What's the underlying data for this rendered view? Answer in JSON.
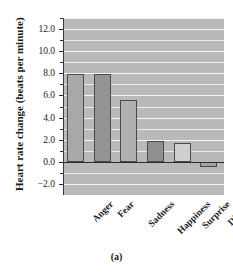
{
  "figure": {
    "caption": "(a)",
    "ylabel": "Heart rate change (beats per minute)"
  },
  "chart_data": {
    "type": "bar",
    "title": "",
    "xlabel": "",
    "ylabel": "Heart rate change (beats per minute)",
    "categories": [
      "Anger",
      "Fear",
      "Sadness",
      "Happiness",
      "Surprise",
      "Disgust"
    ],
    "values": [
      7.9,
      7.9,
      5.6,
      1.9,
      1.7,
      -0.5
    ],
    "bar_colors": [
      "#a8a8a8",
      "#949494",
      "#b0b0b0",
      "#8f8f8f",
      "#cfcfcf",
      "#a3a3a3"
    ],
    "ylim": [
      -3.0,
      13.0
    ],
    "ytick_labels": [
      "12.0",
      "10.0",
      "8.0",
      "6.0",
      "4.0",
      "2.0",
      "0.0",
      "-2.0"
    ],
    "ytick_values": [
      12.0,
      10.0,
      8.0,
      6.0,
      4.0,
      2.0,
      0.0,
      -2.0
    ],
    "ytick_minor_values": [
      13.0,
      11.0,
      9.0,
      7.0,
      5.0,
      3.0,
      1.0,
      -1.0
    ],
    "grid": true,
    "grid_step": 1.0,
    "legend": "none",
    "plot_bgcolor": "#b9b9b9",
    "gridline_color": "#efefef",
    "axis_color": "#2b2b2b"
  }
}
